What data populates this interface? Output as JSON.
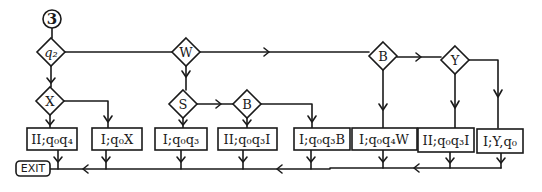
{
  "diagram": {
    "type": "flowchart",
    "start_node": {
      "label": "3"
    },
    "decisions": [
      {
        "id": "q2",
        "label": "q₂"
      },
      {
        "id": "X",
        "label": "X"
      },
      {
        "id": "W",
        "label": "W"
      },
      {
        "id": "S",
        "label": "S"
      },
      {
        "id": "B1",
        "label": "B"
      },
      {
        "id": "B2",
        "label": "B"
      },
      {
        "id": "Y",
        "label": "Y"
      }
    ],
    "actions": [
      {
        "id": "a1",
        "label": "II;q₀q₄"
      },
      {
        "id": "a2",
        "label": "I;q₀X"
      },
      {
        "id": "a3",
        "label": "I;q₀q₃"
      },
      {
        "id": "a4",
        "label": "II;q₀q₃I"
      },
      {
        "id": "a5",
        "label": "I;q₀q₃B"
      },
      {
        "id": "a6",
        "label": "I;q₀q₄W"
      },
      {
        "id": "a7",
        "label": "II;q₀q₃I"
      },
      {
        "id": "a8",
        "label": "I;Y,q₀"
      }
    ],
    "terminal": {
      "label": "EXIT"
    },
    "colors": {
      "stroke": "#1a1a1a",
      "background": "#ffffff"
    }
  }
}
